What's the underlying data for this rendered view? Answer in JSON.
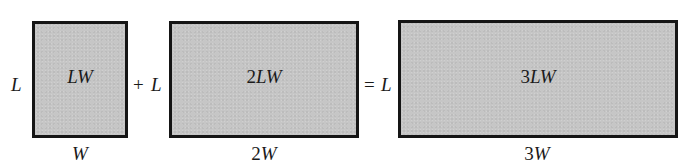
{
  "diagram": {
    "colors": {
      "fill": "#c6c6c6",
      "border": "#151515",
      "text": "#1a1a1a",
      "background": "#ffffff"
    },
    "operators": {
      "plus": "+",
      "equals": "="
    },
    "rectangles": [
      {
        "id": "rect1",
        "side_label": "L",
        "area_coeff": "",
        "area_var": "LW",
        "bottom_coeff": "",
        "bottom_var": "W"
      },
      {
        "id": "rect2",
        "side_label": "L",
        "area_coeff": "2",
        "area_var": "LW",
        "bottom_coeff": "2",
        "bottom_var": "W"
      },
      {
        "id": "rect3",
        "side_label": "L",
        "area_coeff": "3",
        "area_var": "LW",
        "bottom_coeff": "3",
        "bottom_var": "W"
      }
    ],
    "equation": "LW + 2LW = 3LW"
  }
}
